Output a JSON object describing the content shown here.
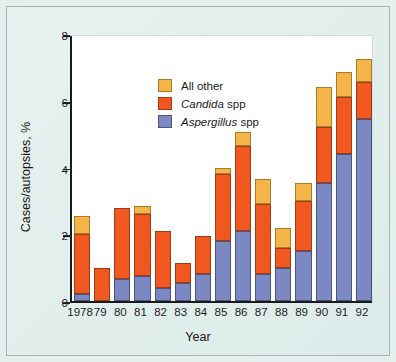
{
  "figure": {
    "background_color": "#e4f0ee",
    "plot_background_color": "#ffffff",
    "border_color": "#a8b4b4"
  },
  "chart_data": {
    "type": "bar",
    "subtype": "stacked-vertical",
    "title": "",
    "xlabel": "Year",
    "ylabel": "Cases/autopsies, %",
    "ylim": [
      0,
      8
    ],
    "yticks": [
      0,
      2,
      4,
      6,
      8
    ],
    "ytick_labels": [
      "0",
      "2",
      "4",
      "6",
      "8"
    ],
    "grid": false,
    "legend_position": "top-left",
    "categories": [
      "1978",
      "79",
      "80",
      "81",
      "82",
      "83",
      "84",
      "85",
      "86",
      "87",
      "88",
      "89",
      "90",
      "91",
      "92"
    ],
    "series": [
      {
        "name": "Aspergillus spp",
        "italic_genus": "Aspergillus",
        "suffix": " spp",
        "color": "#7b88c2",
        "values": [
          0.2,
          0.0,
          0.65,
          0.75,
          0.4,
          0.55,
          0.8,
          1.8,
          2.1,
          0.8,
          1.0,
          1.5,
          3.55,
          4.4,
          5.45
        ]
      },
      {
        "name": "Candida spp",
        "italic_genus": "Candida",
        "suffix": " spp",
        "color": "#f0581f",
        "values": [
          1.8,
          1.0,
          2.15,
          1.85,
          1.7,
          0.6,
          1.15,
          2.0,
          2.55,
          2.1,
          0.6,
          1.5,
          1.65,
          1.7,
          1.1
        ]
      },
      {
        "name": "All other",
        "italic_genus": "",
        "suffix": "All other",
        "color": "#f4b548",
        "values": [
          0.55,
          0.0,
          0.0,
          0.25,
          0.0,
          0.0,
          0.0,
          0.2,
          0.4,
          0.75,
          0.6,
          0.55,
          1.2,
          0.75,
          0.7
        ]
      }
    ],
    "totals": [
      2.55,
      1.0,
      2.8,
      2.85,
      2.1,
      1.15,
      1.95,
      4.0,
      5.05,
      3.65,
      2.2,
      3.55,
      6.4,
      6.85,
      7.25
    ]
  },
  "legend": {
    "entries": [
      {
        "label": "All other",
        "genus": "",
        "rest": "All other",
        "color": "#f4b548"
      },
      {
        "label": "Candida spp",
        "genus": "Candida",
        "rest": " spp",
        "color": "#f0581f"
      },
      {
        "label": "Aspergillus spp",
        "genus": "Aspergillus",
        "rest": " spp",
        "color": "#7b88c2"
      }
    ]
  }
}
